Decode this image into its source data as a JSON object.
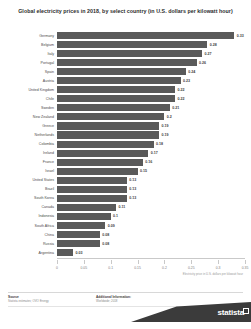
{
  "chart": {
    "title": "Global electricity prices in 2018, by select country (in U.S. dollars per kilowatt hour)"
  },
  "footer": {
    "source_heading": "Source",
    "source_body": "Statista estimates; OVO Energy",
    "additional_heading": "Additional Information:",
    "additional_body": "Worldwide; 2018",
    "brand": "statista"
  },
  "chart_data": {
    "type": "bar",
    "orientation": "horizontal",
    "title": "Global electricity prices in 2018, by select country (in U.S. dollars per kilowatt hour)",
    "xlabel": "Electricity price in U.S. dollars per kilowatt hour",
    "ylabel": "",
    "xlim": [
      0,
      0.35
    ],
    "xticks": [
      0,
      0.05,
      0.1,
      0.15,
      0.2,
      0.25,
      0.3,
      0.35
    ],
    "xticklabels": [
      "0",
      "0.05",
      "0.1",
      "0.15",
      "0.2",
      "0.25",
      "0.3",
      "0.35"
    ],
    "grid": false,
    "legend": false,
    "bar_color": "#5a5a5a",
    "categories": [
      "Germany",
      "Belgium",
      "Italy",
      "Portugal",
      "Spain",
      "Austria",
      "United Kingdom",
      "Chile",
      "Sweden",
      "New Zealand",
      "Greece",
      "Netherlands",
      "Colombia",
      "Ireland",
      "France",
      "Israel",
      "United States",
      "Brazil",
      "South Korea",
      "Canada",
      "Indonesia",
      "South Africa",
      "China",
      "Russia",
      "Argentina"
    ],
    "values": [
      0.33,
      0.28,
      0.27,
      0.26,
      0.24,
      0.23,
      0.22,
      0.22,
      0.21,
      0.2,
      0.19,
      0.19,
      0.18,
      0.17,
      0.16,
      0.15,
      0.13,
      0.13,
      0.13,
      0.11,
      0.1,
      0.09,
      0.08,
      0.08,
      0.03
    ],
    "value_labels": [
      "0.33",
      "0.28",
      "0.27",
      "0.26",
      "0.24",
      "0.23",
      "0.22",
      "0.22",
      "0.21",
      "0.2",
      "0.19",
      "0.19",
      "0.18",
      "0.17",
      "0.16",
      "0.15",
      "0.13",
      "0.13",
      "0.13",
      "0.11",
      "0.1",
      "0.09",
      "0.08",
      "0.08",
      "0.03"
    ]
  }
}
